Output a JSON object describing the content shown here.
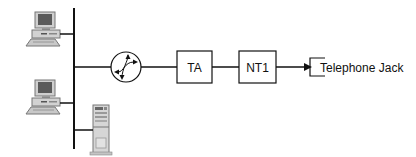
{
  "diagram": {
    "nodes": [
      {
        "id": "pc1",
        "type": "desktop-computer",
        "label": ""
      },
      {
        "id": "pc2",
        "type": "desktop-computer",
        "label": ""
      },
      {
        "id": "server",
        "type": "tower-server",
        "label": ""
      },
      {
        "id": "router",
        "type": "router",
        "label": ""
      },
      {
        "id": "ta",
        "type": "box",
        "label": "TA"
      },
      {
        "id": "nt1",
        "type": "box",
        "label": "NT1"
      },
      {
        "id": "jack",
        "type": "telephone-jack",
        "label": "Telephone Jack"
      }
    ],
    "edges": [
      {
        "from": "pc1",
        "to": "bus"
      },
      {
        "from": "pc2",
        "to": "bus"
      },
      {
        "from": "server",
        "to": "bus"
      },
      {
        "from": "bus",
        "to": "router"
      },
      {
        "from": "router",
        "to": "ta"
      },
      {
        "from": "ta",
        "to": "nt1"
      },
      {
        "from": "nt1",
        "to": "jack",
        "arrow": true
      }
    ],
    "colors": {
      "line": "#111111",
      "device_light": "#d4d4d4",
      "device_mid": "#a8a8a8",
      "device_dark": "#6e6e6e",
      "screen": "#555555"
    }
  }
}
